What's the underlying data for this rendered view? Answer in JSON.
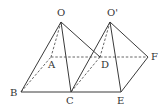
{
  "diagram": {
    "type": "geometry-figure",
    "points": {
      "O": {
        "label": "O",
        "x": 61,
        "y": 22,
        "lx": 57,
        "ly": 16
      },
      "O2": {
        "label": "O'",
        "x": 110,
        "y": 22,
        "lx": 107,
        "ly": 16
      },
      "A": {
        "label": "A",
        "x": 51,
        "y": 57,
        "lx": 48,
        "ly": 68
      },
      "D": {
        "label": "D",
        "x": 100,
        "y": 57,
        "lx": 101,
        "ly": 68
      },
      "F": {
        "label": "F",
        "x": 148,
        "y": 57,
        "lx": 151,
        "ly": 60
      },
      "B": {
        "label": "B",
        "x": 21,
        "y": 92,
        "lx": 10,
        "ly": 96
      },
      "C": {
        "label": "C",
        "x": 71,
        "y": 92,
        "lx": 66,
        "ly": 104
      },
      "E": {
        "label": "E",
        "x": 121,
        "y": 92,
        "lx": 117,
        "ly": 104
      }
    },
    "solid_edges": [
      [
        "O",
        "B"
      ],
      [
        "O",
        "C"
      ],
      [
        "O",
        "D"
      ],
      [
        "O2",
        "C"
      ],
      [
        "O2",
        "E"
      ],
      [
        "O2",
        "F"
      ],
      [
        "B",
        "C"
      ],
      [
        "C",
        "E"
      ],
      [
        "E",
        "F"
      ]
    ],
    "dashed_edges": [
      [
        "O",
        "A"
      ],
      [
        "B",
        "A"
      ],
      [
        "A",
        "D"
      ],
      [
        "D",
        "F"
      ],
      [
        "O2",
        "D"
      ],
      [
        "C",
        "D"
      ]
    ],
    "colors": {
      "line": "#3a3a3a",
      "dashed": "#555555",
      "label": "#333333",
      "background": "#ffffff"
    }
  }
}
